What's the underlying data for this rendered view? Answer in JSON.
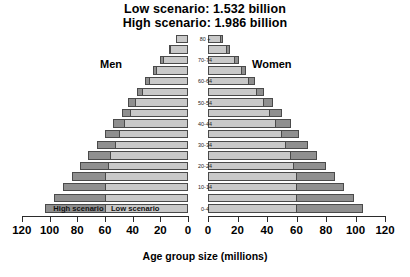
{
  "title": {
    "line1": "Low scenario: 1.532 billion",
    "line2": "High scenario: 1.986 billion"
  },
  "labels": {
    "men": "Men",
    "women": "Women",
    "axis_title": "Age group size (millions)",
    "legend_high": "High scenario",
    "legend_low": "Low scenario"
  },
  "colors": {
    "low": "#c9c9c9",
    "high": "#8f8f8f",
    "outline": "#4a4a4a",
    "axis": "#2b2b2b",
    "background": "#ffffff"
  },
  "chart_data": {
    "type": "bar",
    "subtype": "population-pyramid",
    "xlabel": "Age group size (millions)",
    "ylabel": "",
    "xlim": [
      0,
      120
    ],
    "grid": false,
    "legend_position": "inside-bottom-bar",
    "tick_values": [
      120,
      100,
      80,
      60,
      40,
      20,
      0,
      0,
      20,
      40,
      60,
      80,
      100,
      120
    ],
    "tick_labels": [
      "120",
      "100",
      "80",
      "60",
      "40",
      "20",
      "0",
      "0",
      "20",
      "40",
      "60",
      "80",
      "100",
      "120"
    ],
    "categories": [
      "0-4",
      "5-9",
      "10-14",
      "15-19",
      "20-24",
      "25-29",
      "30-34",
      "35-39",
      "40-44",
      "45-49",
      "50-54",
      "55-59",
      "60-64",
      "65-69",
      "70-74",
      "75-79",
      "80 +"
    ],
    "visible_category_labels": [
      "0-4",
      "",
      "10-14",
      "",
      "20-24",
      "",
      "30-34",
      "",
      "40-44",
      "",
      "50-54",
      "",
      "60-64",
      "",
      "70-74",
      "",
      "80 +"
    ],
    "series": [
      {
        "name": "Men low scenario",
        "side": "left",
        "values": [
          60,
          60,
          60,
          60,
          58,
          56,
          53,
          50,
          46,
          42,
          38,
          33,
          28,
          23,
          18,
          13,
          9
        ]
      },
      {
        "name": "Men high scenario",
        "side": "left",
        "values": [
          103,
          97,
          90,
          84,
          78,
          72,
          66,
          60,
          54,
          48,
          43,
          37,
          31,
          25,
          20,
          14,
          9
        ]
      },
      {
        "name": "Women low scenario",
        "side": "right",
        "values": [
          60,
          60,
          60,
          60,
          58,
          56,
          53,
          50,
          46,
          42,
          38,
          33,
          28,
          23,
          18,
          13,
          9
        ]
      },
      {
        "name": "Women high scenario",
        "side": "right",
        "values": [
          105,
          99,
          92,
          86,
          80,
          74,
          68,
          62,
          56,
          50,
          44,
          38,
          32,
          26,
          21,
          15,
          10
        ]
      }
    ]
  },
  "geometry": {
    "center_left_px": 188,
    "center_right_px": 208,
    "px_per_unit_left": 1.385,
    "px_per_unit_right": 1.475,
    "row_height_px": 10.6,
    "plot_top_px": 34
  }
}
